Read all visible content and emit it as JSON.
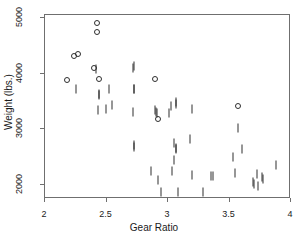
{
  "chart_data": {
    "type": "scatter",
    "title": "",
    "xlabel": "Gear Ratio",
    "ylabel": "Weight (lbs.)",
    "xlim": [
      2,
      4
    ],
    "ylim": [
      1750,
      5050
    ],
    "xticks": [
      2,
      2.5,
      3,
      3.5,
      4
    ],
    "xticklabels": [
      "2",
      "2.5",
      "3",
      "3.5",
      "4"
    ],
    "yticks": [
      2000,
      3000,
      4000,
      5000
    ],
    "yticklabels": [
      "2000",
      "3000",
      "4000",
      "5000"
    ],
    "grid": false,
    "legend": null,
    "marker_styles": {
      "tick": "vertical-bar",
      "circle": "open-circle"
    },
    "points": [
      {
        "x": 2.19,
        "y": 3870,
        "m": "circle"
      },
      {
        "x": 2.24,
        "y": 4290,
        "m": "circle"
      },
      {
        "x": 2.28,
        "y": 4330,
        "m": "circle"
      },
      {
        "x": 2.26,
        "y": 3700,
        "m": "tick"
      },
      {
        "x": 2.41,
        "y": 4080,
        "m": "circle"
      },
      {
        "x": 2.42,
        "y": 4060,
        "m": "tick"
      },
      {
        "x": 2.43,
        "y": 4880,
        "m": "circle"
      },
      {
        "x": 2.43,
        "y": 4720,
        "m": "circle"
      },
      {
        "x": 2.45,
        "y": 3880,
        "m": "circle"
      },
      {
        "x": 2.45,
        "y": 3620,
        "m": "tick"
      },
      {
        "x": 2.45,
        "y": 3600,
        "m": "tick"
      },
      {
        "x": 2.44,
        "y": 3330,
        "m": "tick"
      },
      {
        "x": 2.5,
        "y": 3340,
        "m": "tick"
      },
      {
        "x": 2.53,
        "y": 3700,
        "m": "tick"
      },
      {
        "x": 2.55,
        "y": 3420,
        "m": "tick"
      },
      {
        "x": 2.72,
        "y": 4080,
        "m": "tick"
      },
      {
        "x": 2.73,
        "y": 4120,
        "m": "tick"
      },
      {
        "x": 2.73,
        "y": 3710,
        "m": "tick"
      },
      {
        "x": 2.73,
        "y": 3700,
        "m": "tick"
      },
      {
        "x": 2.72,
        "y": 3290,
        "m": "tick"
      },
      {
        "x": 2.73,
        "y": 2700,
        "m": "tick"
      },
      {
        "x": 2.73,
        "y": 2660,
        "m": "tick"
      },
      {
        "x": 2.9,
        "y": 3880,
        "m": "circle"
      },
      {
        "x": 2.9,
        "y": 3330,
        "m": "tick"
      },
      {
        "x": 2.91,
        "y": 3300,
        "m": "tick"
      },
      {
        "x": 2.92,
        "y": 3280,
        "m": "tick"
      },
      {
        "x": 2.93,
        "y": 3170,
        "m": "circle"
      },
      {
        "x": 2.87,
        "y": 2230,
        "m": "tick"
      },
      {
        "x": 2.93,
        "y": 2080,
        "m": "tick"
      },
      {
        "x": 2.95,
        "y": 1850,
        "m": "tick"
      },
      {
        "x": 3.03,
        "y": 3400,
        "m": "tick"
      },
      {
        "x": 3.02,
        "y": 3270,
        "m": "tick"
      },
      {
        "x": 3.07,
        "y": 3470,
        "m": "tick"
      },
      {
        "x": 3.07,
        "y": 3430,
        "m": "tick"
      },
      {
        "x": 3.06,
        "y": 2740,
        "m": "tick"
      },
      {
        "x": 3.07,
        "y": 2640,
        "m": "tick"
      },
      {
        "x": 3.07,
        "y": 2620,
        "m": "tick"
      },
      {
        "x": 3.06,
        "y": 2440,
        "m": "tick"
      },
      {
        "x": 3.04,
        "y": 2230,
        "m": "tick"
      },
      {
        "x": 3.09,
        "y": 1850,
        "m": "tick"
      },
      {
        "x": 3.2,
        "y": 3350,
        "m": "tick"
      },
      {
        "x": 3.19,
        "y": 2800,
        "m": "tick"
      },
      {
        "x": 3.2,
        "y": 2160,
        "m": "tick"
      },
      {
        "x": 3.29,
        "y": 1850,
        "m": "tick"
      },
      {
        "x": 3.36,
        "y": 2150,
        "m": "tick"
      },
      {
        "x": 3.37,
        "y": 2150,
        "m": "tick"
      },
      {
        "x": 3.54,
        "y": 2480,
        "m": "tick"
      },
      {
        "x": 3.55,
        "y": 2190,
        "m": "tick"
      },
      {
        "x": 3.58,
        "y": 3400,
        "m": "circle"
      },
      {
        "x": 3.58,
        "y": 3000,
        "m": "tick"
      },
      {
        "x": 3.61,
        "y": 2630,
        "m": "tick"
      },
      {
        "x": 3.7,
        "y": 2030,
        "m": "tick"
      },
      {
        "x": 3.71,
        "y": 2000,
        "m": "tick"
      },
      {
        "x": 3.73,
        "y": 2180,
        "m": "tick"
      },
      {
        "x": 3.74,
        "y": 1960,
        "m": "tick"
      },
      {
        "x": 3.77,
        "y": 2120,
        "m": "tick"
      },
      {
        "x": 3.78,
        "y": 2090,
        "m": "tick"
      },
      {
        "x": 3.89,
        "y": 2340,
        "m": "tick"
      }
    ]
  }
}
